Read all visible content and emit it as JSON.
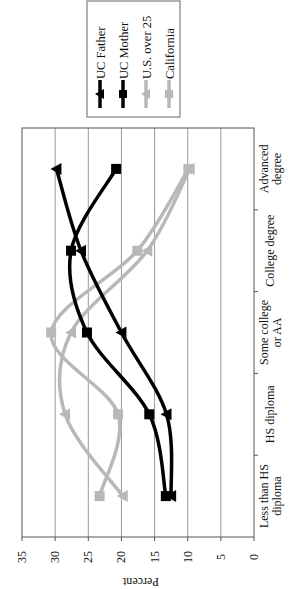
{
  "chart_data": {
    "type": "line",
    "orientation": "rotated-90-ccw",
    "title": "",
    "xlabel": "",
    "ylabel": "Percent",
    "ylim": [
      0,
      35
    ],
    "yticks": [
      0,
      5,
      10,
      15,
      20,
      25,
      30,
      35
    ],
    "grid": true,
    "legend_position": "right",
    "categories": [
      "Less than HS diploma",
      "HS diploma",
      "Some college or AA",
      "College degree",
      "Advanced degree"
    ],
    "category_lines": [
      [
        "Less than HS",
        "diploma"
      ],
      [
        "HS diploma"
      ],
      [
        "Some college",
        "or AA"
      ],
      [
        "College degree"
      ],
      [
        "Advanced",
        "degree"
      ]
    ],
    "series": [
      {
        "name": "UC Father",
        "marker": "triangle",
        "color": "#000000",
        "values": [
          12.5,
          13.2,
          20.0,
          26.1,
          29.8
        ]
      },
      {
        "name": "UC Mother",
        "marker": "square",
        "color": "#000000",
        "values": [
          13.3,
          15.8,
          25.2,
          27.6,
          20.8
        ]
      },
      {
        "name": "U.S. over 25",
        "marker": "triangle",
        "color": "#b8b8b8",
        "values": [
          19.8,
          28.5,
          27.6,
          16.1,
          9.7
        ]
      },
      {
        "name": "California",
        "marker": "square",
        "color": "#b8b8b8",
        "values": [
          23.3,
          20.5,
          30.6,
          17.6,
          9.9
        ]
      }
    ]
  }
}
